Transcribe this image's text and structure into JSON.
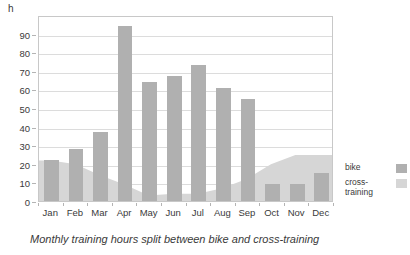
{
  "chart_data": {
    "type": "bar",
    "title": "",
    "caption": "Monthly training hours split between bike and cross-training",
    "xlabel": "",
    "ylabel": "h",
    "unit": "h",
    "ylim": [
      0,
      100
    ],
    "ytick_values": [
      0,
      10,
      20,
      30,
      40,
      50,
      60,
      70,
      80,
      90
    ],
    "ytick_labels": [
      "0",
      "10",
      "20",
      "30",
      "40",
      "50",
      "60",
      "70",
      "80",
      "90"
    ],
    "grid": true,
    "legend_position": "right",
    "categories": [
      "Jan",
      "Feb",
      "Mar",
      "Apr",
      "May",
      "Jun",
      "Jul",
      "Aug",
      "Sep",
      "Oct",
      "Nov",
      "Dec"
    ],
    "series": [
      {
        "name": "bike",
        "render": "bar",
        "color": "#b0b0b0",
        "values": [
          22,
          28,
          37,
          94,
          64,
          67,
          73,
          61,
          55,
          9,
          9,
          15
        ]
      },
      {
        "name": "cross-training",
        "render": "area",
        "color": "#d6d6d6",
        "values": [
          22,
          20,
          14,
          9,
          3,
          4,
          4,
          7,
          12,
          20,
          25,
          25
        ]
      }
    ]
  },
  "legend": {
    "items": [
      {
        "label": "bike",
        "color": "#b0b0b0"
      },
      {
        "label": "cross-training",
        "color": "#d6d6d6"
      }
    ]
  },
  "colors": {
    "bike": "#b0b0b0",
    "cross_training": "#d6d6d6",
    "grid": "#dcdcdc",
    "frame": "#c8c8c8",
    "text": "#3a3a3a",
    "background": "#ffffff"
  }
}
